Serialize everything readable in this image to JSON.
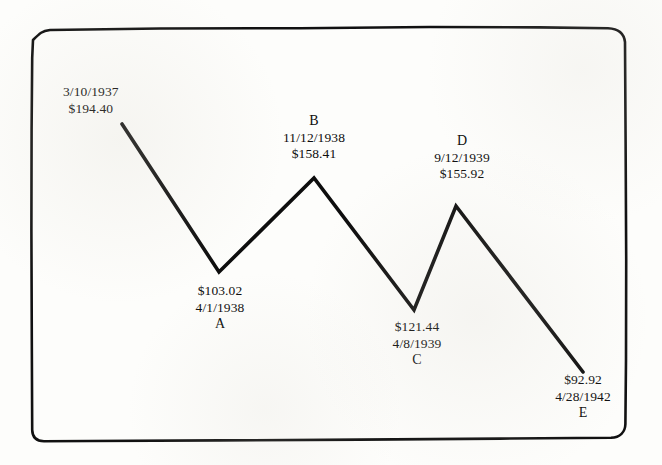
{
  "document": {
    "type": "hand-drawn price swing chart on scanned paper",
    "background_color": "#fdfdfb",
    "ink_color": "#101010"
  },
  "chart_data": {
    "type": "line",
    "title": "",
    "xlabel": "",
    "ylabel": "",
    "grid": false,
    "legend": "none",
    "x": [
      "3/10/1937",
      "4/1/1938",
      "11/12/1938",
      "4/8/1939",
      "9/12/1939",
      "4/28/1942"
    ],
    "values": [
      194.4,
      103.02,
      158.41,
      121.44,
      155.92,
      92.92
    ],
    "point_labels": [
      "",
      "A",
      "B",
      "C",
      "D",
      "E"
    ],
    "points": [
      {
        "letter": "",
        "date": "3/10/1937",
        "price": "$194.40",
        "value": 194.4,
        "px": 122,
        "py": 124
      },
      {
        "letter": "A",
        "date": "4/1/1938",
        "price": "$103.02",
        "value": 103.02,
        "px": 219,
        "py": 272
      },
      {
        "letter": "B",
        "date": "11/12/1938",
        "price": "$158.41",
        "value": 158.41,
        "px": 314,
        "py": 178
      },
      {
        "letter": "C",
        "date": "4/8/1939",
        "price": "$121.44",
        "value": 121.44,
        "px": 414,
        "py": 310
      },
      {
        "letter": "D",
        "date": "9/12/1939",
        "price": "$155.92",
        "value": 155.92,
        "px": 456,
        "py": 206
      },
      {
        "letter": "E",
        "date": "4/28/1942",
        "price": "$92.92",
        "value": 92.92,
        "px": 583,
        "py": 372
      }
    ]
  },
  "annotations": {
    "start": {
      "date": "3/10/1937",
      "price": "$194.40"
    },
    "a": {
      "price": "$103.02",
      "date": "4/1/1938",
      "letter": "A"
    },
    "b": {
      "letter": "B",
      "date": "11/12/1938",
      "price": "$158.41"
    },
    "c": {
      "price": "$121.44",
      "date": "4/8/1939",
      "letter": "C"
    },
    "d": {
      "letter": "D",
      "date": "9/12/1939",
      "price": "$155.92"
    },
    "e": {
      "price": "$92.92",
      "date": "4/28/1942",
      "letter": "E"
    }
  }
}
